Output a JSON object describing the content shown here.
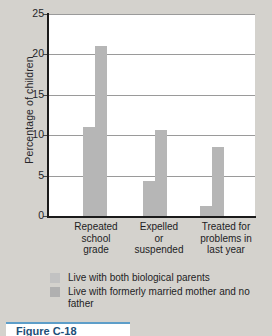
{
  "chart_data": {
    "type": "bar",
    "title": "",
    "xlabel": "",
    "ylabel": "Percentage of children",
    "ylim": [
      0,
      25
    ],
    "yticks": [
      0,
      5,
      10,
      15,
      20,
      25
    ],
    "ytick_labels": [
      "0",
      "5",
      "10",
      "15",
      "20",
      "25"
    ],
    "grid": true,
    "legend_position": "below-axes",
    "categories": [
      "Repeated school grade",
      "Expelled or suspended",
      "Treated for problems in last year"
    ],
    "category_lines": [
      [
        "Repeated",
        "school",
        "grade"
      ],
      [
        "Expelled",
        "or",
        "suspended"
      ],
      [
        "Treated for",
        "problems in",
        "last year"
      ]
    ],
    "series": [
      {
        "name": "Live with both biological parents",
        "color": "#b6b6b6",
        "values": [
          11.0,
          4.3,
          1.2
        ]
      },
      {
        "name": "Live with formerly married mother and no father",
        "color": "#b6b6b6",
        "values": [
          21.0,
          10.6,
          8.5
        ]
      }
    ]
  },
  "legend": {
    "items": [
      {
        "label": "Live with both biological parents",
        "swatch": "#c2c2c2"
      },
      {
        "label": "Live with formerly married mother and no father",
        "swatch": "#b0b0b0"
      }
    ]
  },
  "caption": {
    "text": "Figure  C-18"
  },
  "colors": {
    "background": "#d4d2cd",
    "plot_background": "#ffffff",
    "axis": "#1b1b1b",
    "gridline": "#9a9a9a",
    "bar": "#b6b6b6",
    "text": "#1d1d1f",
    "caption_accent": "#5d9ec9"
  }
}
